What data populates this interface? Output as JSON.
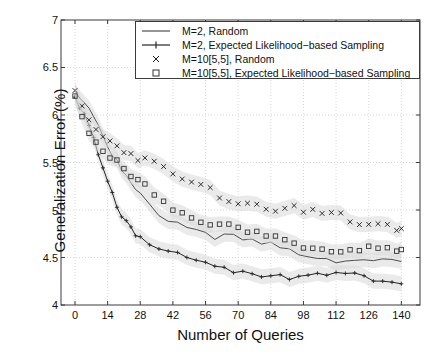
{
  "chart_data": {
    "type": "line",
    "title": "",
    "xlabel": "Number of Queries",
    "ylabel": "Generalization Error (%)",
    "xlim": [
      -6,
      148
    ],
    "ylim": [
      4,
      7
    ],
    "xticks": [
      0,
      14,
      28,
      42,
      56,
      70,
      84,
      98,
      112,
      126,
      140
    ],
    "yticks": [
      4,
      4.5,
      5,
      5.5,
      6,
      6.5,
      7
    ],
    "grid": true,
    "legend_position": "top-right",
    "series": [
      {
        "name": "M=2, Random",
        "marker": "none",
        "style": "line",
        "color": "#4d4d4d",
        "x": [
          0,
          2,
          4,
          6,
          8,
          10,
          12,
          14,
          16,
          18,
          20,
          22,
          24,
          26,
          28,
          32,
          36,
          40,
          44,
          48,
          52,
          56,
          60,
          64,
          68,
          72,
          76,
          80,
          84,
          88,
          92,
          96,
          100,
          104,
          108,
          112,
          116,
          120,
          124,
          128,
          132,
          136,
          140
        ],
        "y": [
          6.27,
          6.22,
          6.18,
          6.13,
          6.05,
          5.93,
          5.82,
          5.72,
          5.62,
          5.53,
          5.44,
          5.36,
          5.28,
          5.22,
          5.16,
          5.07,
          5.0,
          4.95,
          4.9,
          4.86,
          4.83,
          4.8,
          4.77,
          4.74,
          4.72,
          4.7,
          4.68,
          4.66,
          4.64,
          4.62,
          4.6,
          4.58,
          4.57,
          4.55,
          4.54,
          4.52,
          4.51,
          4.5,
          4.49,
          4.48,
          4.47,
          4.46,
          4.45
        ]
      },
      {
        "name": "M=2, Expected Likelihood-based Sampling",
        "marker": "plus",
        "style": "line-marker",
        "color": "#262626",
        "x": [
          0,
          2,
          4,
          6,
          8,
          10,
          12,
          14,
          16,
          18,
          20,
          22,
          24,
          26,
          28,
          32,
          36,
          40,
          44,
          48,
          52,
          56,
          60,
          64,
          68,
          72,
          76,
          80,
          84,
          88,
          92,
          96,
          100,
          104,
          108,
          112,
          116,
          120,
          124,
          128,
          132,
          136,
          140
        ],
        "y": [
          6.27,
          6.15,
          6.02,
          5.9,
          5.74,
          5.58,
          5.44,
          5.3,
          5.18,
          5.08,
          4.99,
          4.92,
          4.86,
          4.8,
          4.76,
          4.68,
          4.62,
          4.57,
          4.53,
          4.5,
          4.47,
          4.45,
          4.43,
          4.42,
          4.4,
          4.39,
          4.38,
          4.37,
          4.36,
          4.36,
          4.35,
          4.35,
          4.34,
          4.34,
          4.33,
          4.33,
          4.32,
          4.32,
          4.31,
          4.31,
          4.31,
          4.3,
          4.3
        ]
      },
      {
        "name": "M=10[5,5], Random",
        "marker": "x",
        "style": "marker",
        "color": "#1a1a1a",
        "x": [
          0,
          3,
          6,
          9,
          12,
          15,
          18,
          21,
          24,
          27,
          30,
          34,
          38,
          42,
          46,
          50,
          54,
          58,
          62,
          66,
          70,
          74,
          78,
          82,
          86,
          90,
          94,
          98,
          102,
          106,
          110,
          114,
          118,
          122,
          126,
          130,
          134,
          138,
          140
        ],
        "y": [
          6.27,
          6.1,
          5.96,
          5.88,
          5.82,
          5.76,
          5.72,
          5.68,
          5.63,
          5.6,
          5.56,
          5.5,
          5.45,
          5.4,
          5.35,
          5.31,
          5.27,
          5.24,
          5.2,
          5.17,
          5.14,
          5.12,
          5.1,
          5.08,
          5.06,
          5.04,
          5.02,
          5.0,
          4.99,
          4.97,
          4.96,
          4.95,
          4.93,
          4.92,
          4.91,
          4.9,
          4.88,
          4.86,
          4.85
        ]
      },
      {
        "name": "M=10[5,5], Expected Likelihood-based Sampling",
        "marker": "square",
        "style": "marker",
        "color": "#333333",
        "x": [
          0,
          3,
          6,
          9,
          12,
          15,
          18,
          21,
          24,
          27,
          30,
          34,
          38,
          42,
          46,
          50,
          54,
          58,
          62,
          66,
          70,
          74,
          78,
          82,
          86,
          90,
          94,
          98,
          102,
          106,
          110,
          114,
          118,
          122,
          126,
          130,
          134,
          138,
          140
        ],
        "y": [
          6.27,
          6.02,
          5.86,
          5.74,
          5.64,
          5.56,
          5.5,
          5.44,
          5.38,
          5.32,
          5.27,
          5.2,
          5.14,
          5.08,
          5.03,
          4.98,
          4.94,
          4.9,
          4.86,
          4.83,
          4.8,
          4.77,
          4.75,
          4.73,
          4.71,
          4.69,
          4.68,
          4.66,
          4.65,
          4.64,
          4.63,
          4.62,
          4.61,
          4.6,
          4.6,
          4.59,
          4.59,
          4.58,
          4.58
        ]
      }
    ],
    "error_band_halfwidth": 0.08
  },
  "legend": {
    "entries": [
      {
        "label": "M=2, Random",
        "marker": "line"
      },
      {
        "label": "M=2, Expected Likelihood−based Sampling",
        "marker": "line-plus"
      },
      {
        "label": "M=10[5,5], Random",
        "marker": "x"
      },
      {
        "label": "M=10[5,5], Expected Likelihood−based Sampling",
        "marker": "square"
      }
    ]
  },
  "axes": {
    "xlabel": "Number of Queries",
    "ylabel": "Generalization Error (%)",
    "xtick_labels": [
      "0",
      "14",
      "28",
      "42",
      "56",
      "70",
      "84",
      "98",
      "112",
      "126",
      "140"
    ],
    "ytick_labels": [
      "7",
      "6.5",
      "6",
      "5.5",
      "5",
      "4.5",
      "4"
    ]
  },
  "colors": {
    "axis": "#3a3a3a",
    "grid": "#cfcfcf",
    "band": "#d9d9d9",
    "text": "#111111",
    "background": "#ffffff"
  }
}
